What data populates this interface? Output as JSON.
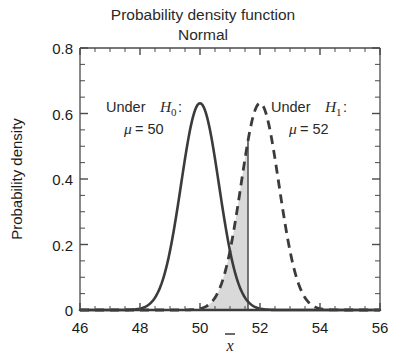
{
  "chart_data": {
    "type": "line",
    "title": "Probability density function",
    "subtitle": "Normal",
    "xlabel": "x̄",
    "ylabel": "Probability density",
    "xlim": [
      46,
      56
    ],
    "ylim": [
      0,
      0.8
    ],
    "xticks": [
      "46",
      "48",
      "50",
      "52",
      "54",
      "56"
    ],
    "xtick_values": [
      46,
      48,
      50,
      52,
      54,
      56
    ],
    "yticks": [
      "0",
      "0.2",
      "0.4",
      "0.6",
      "0.8"
    ],
    "ytick_values": [
      0,
      0.2,
      0.4,
      0.6,
      0.8
    ],
    "x_minor_tick_step": 0.5,
    "y_minor_tick_step": 0.05,
    "grid": false,
    "legend_position": "inline-annotations",
    "series": [
      {
        "name": "Under H0",
        "distribution": "normal",
        "mu": 50,
        "sigma": 0.632,
        "peak_density": 0.63,
        "linestyle": "solid",
        "color": "#3b3b3b",
        "linewidth": 2.6
      },
      {
        "name": "Under H1",
        "distribution": "normal",
        "mu": 52,
        "sigma": 0.632,
        "peak_density": 0.63,
        "linestyle": "dashed",
        "color": "#3b3b3b",
        "linewidth": 2.8
      }
    ],
    "annotations": [
      {
        "id": "h0-label",
        "line1_prefix": "Under ",
        "line1_symbol": "H",
        "line1_subscript": "0",
        "line1_suffix": ":",
        "line2_symbol": "μ",
        "line2_text": " = 50",
        "x_data": 48.2,
        "y_data": 0.69
      },
      {
        "id": "h1-label",
        "line1_prefix": "Under ",
        "line1_symbol": "H",
        "line1_subscript": "1",
        "line1_suffix": ":",
        "line2_symbol": "μ",
        "line2_text": " = 52",
        "x_data": 52.6,
        "y_data": 0.69
      }
    ],
    "shaded_region": {
      "label": "critical region under H1 left of cutoff",
      "series": "Under H1",
      "x_from": 50.0,
      "x_to": 51.6,
      "fill_color": "#d9d9d9",
      "edge_line_x": 51.6,
      "edge_line_color": "#555555"
    }
  }
}
